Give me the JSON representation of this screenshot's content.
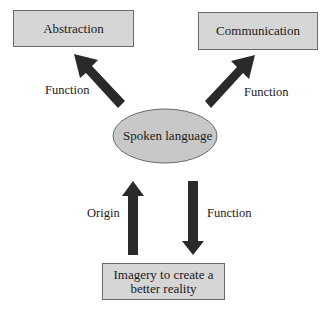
{
  "diagram": {
    "nodes": {
      "abstraction": "Abstraction",
      "communication": "Communication",
      "spoken_language": "Spoken language",
      "imagery": "Imagery to create a better reality"
    },
    "edges": [
      {
        "from": "Spoken language",
        "to": "Abstraction",
        "label": "Function"
      },
      {
        "from": "Spoken language",
        "to": "Communication",
        "label": "Function"
      },
      {
        "from": "Imagery to create a better reality",
        "to": "Spoken language",
        "label": "Origin"
      },
      {
        "from": "Spoken language",
        "to": "Imagery to create a better reality",
        "label": "Function"
      }
    ],
    "labels": {
      "left_top": "Function",
      "right_top": "Function",
      "origin": "Origin",
      "bottom_function": "Function"
    },
    "colors": {
      "box_fill": "#d6d6d6",
      "ellipse_fill": "#c8c8c8",
      "arrow": "#2a2a2a",
      "border": "#6a6a6a"
    }
  }
}
